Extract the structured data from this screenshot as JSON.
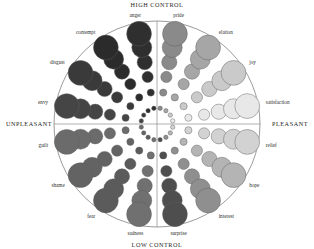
{
  "figure": {
    "type": "circumplex-emotion-diagram",
    "background": "#ffffff",
    "outline_color": "#6e6e6e",
    "axis_color": "#8d8d8d",
    "bubble_stroke": "#5d5d5d"
  },
  "axes": {
    "top": "HIGH CONTROL",
    "bottom": "LOW CONTROL",
    "left": "UNPLEASANT",
    "right": "PLEASANT"
  },
  "chart_data": {
    "type": "scatter",
    "title": "",
    "xlabel": "UNPLEASANT — PLEASANT",
    "ylabel": "LOW CONTROL — HIGH CONTROL",
    "grid": false,
    "legend": "none",
    "encoding": {
      "angle": "emotion spoke",
      "radius": "ring index (1 = center, 6 = rim)",
      "size": "grows with radius",
      "shade": "grayscale by valence: dark = unpleasant, light = pleasant"
    },
    "center": {
      "x": 157,
      "y": 124
    },
    "outer_radius": 103,
    "rings": [
      {
        "ring": 1,
        "radius": 16,
        "bubble_r": 2.2
      },
      {
        "ring": 2,
        "radius": 32,
        "bubble_r": 3.6
      },
      {
        "ring": 3,
        "radius": 48,
        "bubble_r": 5.6
      },
      {
        "ring": 4,
        "radius": 63,
        "bubble_r": 7.6
      },
      {
        "ring": 5,
        "radius": 78,
        "bubble_r": 10.0
      },
      {
        "ring": 6,
        "radius": 92,
        "bubble_r": 12.4
      }
    ],
    "series": [
      {
        "name": "anger",
        "label": "anger",
        "angle_deg": 101.25,
        "shade": "#2f2f2f",
        "label_anchor": "middle"
      },
      {
        "name": "contempt",
        "label": "contempt",
        "angle_deg": 123.75,
        "shade": "#2b2b2b",
        "label_anchor": "end"
      },
      {
        "name": "disgust",
        "label": "disgust",
        "angle_deg": 146.25,
        "shade": "#3a3a3a",
        "label_anchor": "end"
      },
      {
        "name": "envy",
        "label": "envy",
        "angle_deg": 168.75,
        "shade": "#454545",
        "label_anchor": "end"
      },
      {
        "name": "guilt",
        "label": "guilt",
        "angle_deg": 191.25,
        "shade": "#6b6b6b",
        "label_anchor": "end"
      },
      {
        "name": "shame",
        "label": "shame",
        "angle_deg": 213.75,
        "shade": "#636363",
        "label_anchor": "end"
      },
      {
        "name": "fear",
        "label": "fear",
        "angle_deg": 236.25,
        "shade": "#5b5b5b",
        "label_anchor": "end"
      },
      {
        "name": "sadness",
        "label": "sadness",
        "angle_deg": 258.75,
        "shade": "#707070",
        "label_anchor": "middle"
      },
      {
        "name": "surprise",
        "label": "surprise",
        "angle_deg": 281.25,
        "shade": "#4e4e4e",
        "label_anchor": "middle"
      },
      {
        "name": "interest",
        "label": "interest",
        "angle_deg": 303.75,
        "shade": "#8f8f8f",
        "label_anchor": "start"
      },
      {
        "name": "hope",
        "label": "hope",
        "angle_deg": 326.25,
        "shade": "#b4b4b4",
        "label_anchor": "start"
      },
      {
        "name": "relief",
        "label": "relief",
        "angle_deg": 348.75,
        "shade": "#d2d2d2",
        "label_anchor": "start"
      },
      {
        "name": "satisfaction",
        "label": "satisfaction",
        "angle_deg": 11.25,
        "shade": "#e8e8e8",
        "label_anchor": "start"
      },
      {
        "name": "joy",
        "label": "joy",
        "angle_deg": 33.75,
        "shade": "#cacaca",
        "label_anchor": "start"
      },
      {
        "name": "elation",
        "label": "elation",
        "angle_deg": 56.25,
        "shade": "#a6a6a6",
        "label_anchor": "start"
      },
      {
        "name": "pride",
        "label": "pride",
        "angle_deg": 78.75,
        "shade": "#8a8a8a",
        "label_anchor": "middle"
      }
    ]
  }
}
